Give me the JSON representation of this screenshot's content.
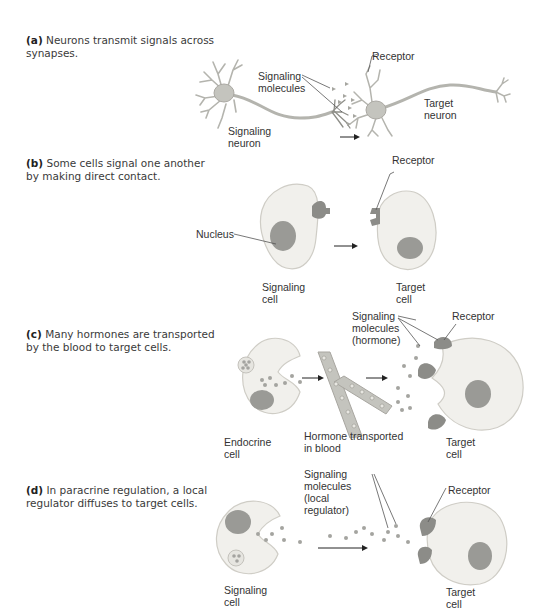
{
  "figure": {
    "panels": [
      {
        "id": "a",
        "letter": "(a)",
        "caption": "Neurons transmit signals across synapses.",
        "labels": {
          "signaling_molecules": "Signaling\nmolecules",
          "receptor": "Receptor",
          "target": "Target\nneuron",
          "source": "Signaling\nneuron"
        }
      },
      {
        "id": "b",
        "letter": "(b)",
        "caption": "Some cells signal one another by making direct contact.",
        "labels": {
          "nucleus": "Nucleus",
          "receptor": "Receptor",
          "source": "Signaling\ncell",
          "target": "Target\ncell"
        }
      },
      {
        "id": "c",
        "letter": "(c)",
        "caption": "Many hormones are transported by the blood to target cells.",
        "labels": {
          "signaling_molecules": "Signaling\nmolecules\n(hormone)",
          "receptor": "Receptor",
          "blood": "Hormone transported\nin blood",
          "source": "Endocrine\ncell",
          "target": "Target\ncell"
        }
      },
      {
        "id": "d",
        "letter": "(d)",
        "caption": "In paracrine regulation, a local regulator diffuses to target cells.",
        "labels": {
          "signaling_molecules": "Signaling\nmolecules\n(local\nregulator)",
          "receptor": "Receptor",
          "source": "Signaling\ncell",
          "target": "Target\ncell"
        }
      }
    ],
    "colors": {
      "cell_fill": "#f1f0ec",
      "cell_stroke": "#cfcdc6",
      "nucleus": "#9a9a96",
      "receptor": "#8c8c88",
      "molecule": "#a4a4a0",
      "line": "#555555",
      "neuron": "#b4b4ae"
    }
  }
}
